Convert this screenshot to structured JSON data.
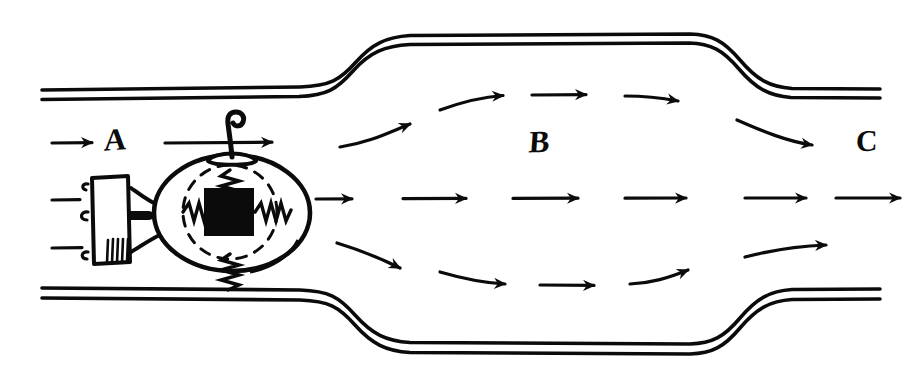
{
  "figure": {
    "kind": "hand-drawn-schematic",
    "ink_color": "#0b0b0b",
    "paper_color": "#ffffff"
  },
  "labels": {
    "inlet": "A",
    "chamber": "B",
    "outlet": "C"
  },
  "regions": [
    {
      "id": "A",
      "name": "inlet-section",
      "label": "A"
    },
    {
      "id": "B",
      "name": "expanded-chamber",
      "label": "B"
    },
    {
      "id": "C",
      "name": "outlet-section",
      "label": "C"
    }
  ],
  "duct": {
    "wall_style": "double-line",
    "inlet_top_y": 92,
    "inlet_bottom_y": 292,
    "chamber_top_y": 36,
    "chamber_bottom_y": 344,
    "left_expansion_x": [
      300,
      400
    ],
    "right_contraction_x": [
      700,
      800
    ]
  },
  "device": {
    "name": "spring-suspended-mass-sensor",
    "body_shape": "ellipse",
    "body_center": [
      232,
      213
    ],
    "body_rx": 78,
    "body_ry": 58,
    "inner_dashed_circle": true,
    "mass_shape": "square",
    "mass_fill": "#0b0b0b",
    "spring_count": 4,
    "spring_directions": [
      "up",
      "down",
      "left",
      "right"
    ],
    "top_fitting": "hook-eyelet",
    "side_module": {
      "name": "terminal-block",
      "shape": "rectangle",
      "left_stub_count": 3,
      "right_stub_count": 1,
      "hatching": true
    }
  },
  "streamlines": {
    "description": "flow arrows pointing left to right through the duct",
    "rows": [
      "upper",
      "center",
      "lower"
    ],
    "direction": "left-to-right",
    "inlet_arrow_count": 3,
    "center_arrow_count": 6,
    "upper_arrow_count": 5,
    "lower_arrow_count": 5
  }
}
